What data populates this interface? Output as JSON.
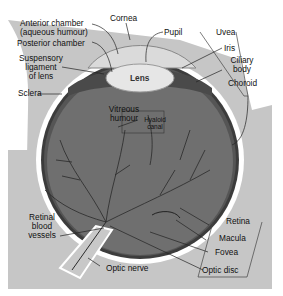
{
  "diagram": {
    "colors": {
      "background_tissue": "#c4c4c4",
      "vitreous": "#6e6e6e",
      "sclera": "#ffffff",
      "choroid": "#3a3a3a",
      "lens": "#e8e8e8",
      "cornea": "#d8d8d8",
      "vessel": "#2a2a2a"
    },
    "labels": {
      "anterior_chamber_1": "Anterior chamber",
      "anterior_chamber_2": "(aqueous humour)",
      "posterior_chamber": "Posterior chamber",
      "suspensory_1": "Suspensory",
      "suspensory_2": "ligament",
      "suspensory_3": "of lens",
      "sclera": "Sclera",
      "cornea": "Cornea",
      "pupil": "Pupil",
      "uvea": "Uvea",
      "iris": "Iris",
      "ciliary_1": "Ciliary",
      "ciliary_2": "body",
      "choroid": "Choroid",
      "lens": "Lens",
      "vitreous_1": "Vitreous",
      "vitreous_2": "humour",
      "hyaloid_1": "Hyaloid",
      "hyaloid_2": "canal",
      "retinal_1": "Retinal",
      "retinal_2": "blood",
      "retinal_3": "vessels",
      "retina": "Retina",
      "macula": "Macula",
      "fovea": "Fovea",
      "optic_nerve": "Optic nerve",
      "optic_disc": "Optic disc"
    }
  }
}
